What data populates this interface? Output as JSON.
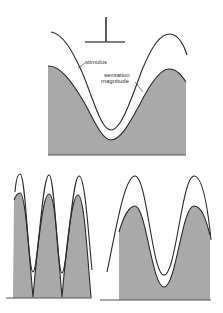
{
  "figure": {
    "panels": [
      {
        "id": "top",
        "description": "Single stimulus cycle with probe symbol",
        "labels": {
          "stimulus": "stimulus",
          "sensation_line1": "sensation",
          "sensation_line2": "magnitude"
        },
        "probe_icon": "probe-t-icon"
      },
      {
        "id": "bottom-left",
        "description": "High-frequency stimulus, three cycles; sensation dips to zero"
      },
      {
        "id": "bottom-right",
        "description": "Low-frequency stimulus, two cycles; sensation stays above baseline"
      }
    ],
    "colors": {
      "shading": "#a9a9a9",
      "curve": "#2a2a2a",
      "background": "#ffffff"
    }
  }
}
